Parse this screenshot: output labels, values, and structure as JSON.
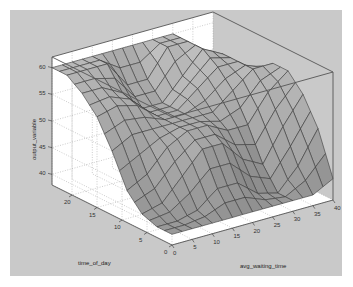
{
  "chart_data": {
    "type": "surface3d",
    "title": "",
    "xlabel": "avg_waiting_time",
    "ylabel": "time_of_day",
    "zlabel": "output_variable",
    "x_ticks": [
      "0",
      "5",
      "10",
      "15",
      "20",
      "25",
      "30",
      "35",
      "40"
    ],
    "y_ticks": [
      "0",
      "5",
      "10",
      "15",
      "20"
    ],
    "z_ticks": [
      "40",
      "45",
      "50",
      "55",
      "60"
    ],
    "xlim": [
      0,
      40
    ],
    "ylim": [
      0,
      24
    ],
    "zlim": [
      38,
      62
    ],
    "grid": true,
    "colormap": "grayscale",
    "x": [
      0,
      5,
      10,
      15,
      20,
      25,
      30,
      35,
      40
    ],
    "y": [
      0,
      3,
      6,
      9,
      12,
      15,
      18,
      21,
      24
    ],
    "z": [
      [
        40,
        40,
        40,
        40,
        40,
        40,
        40,
        40,
        42
      ],
      [
        40,
        40,
        41,
        44,
        44,
        41,
        40,
        44,
        50
      ],
      [
        41,
        42,
        46,
        50,
        50,
        46,
        44,
        50,
        55
      ],
      [
        44,
        46,
        50,
        52,
        52,
        50,
        50,
        55,
        58
      ],
      [
        50,
        52,
        52,
        52,
        52,
        52,
        55,
        58,
        58
      ],
      [
        55,
        56,
        55,
        52,
        52,
        55,
        58,
        58,
        55
      ],
      [
        58,
        58,
        56,
        52,
        52,
        56,
        60,
        58,
        52
      ],
      [
        60,
        60,
        60,
        55,
        55,
        60,
        60,
        56,
        50
      ],
      [
        60,
        60,
        60,
        60,
        60,
        60,
        60,
        55,
        50
      ]
    ]
  },
  "axes": {
    "x_label": "avg_waiting_time",
    "y_label": "time_of_day",
    "z_label": "output_variable"
  }
}
